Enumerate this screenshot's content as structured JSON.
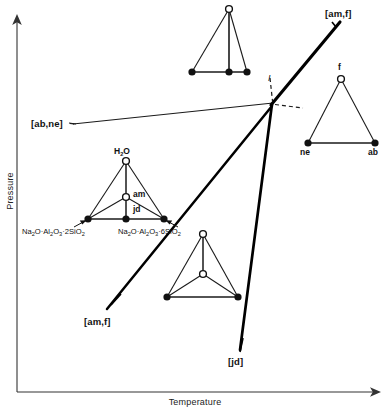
{
  "axes": {
    "y_label": "Pressure",
    "x_label": "Temperature"
  },
  "invariant_point": {
    "label": "I",
    "x": 273,
    "y": 103
  },
  "curve_labels": [
    {
      "id": "ab-ne",
      "text": "[ab,ne]",
      "x": 31,
      "y": 119
    },
    {
      "id": "am-f-upper",
      "text": "[am,f]",
      "x": 325,
      "y": 10
    },
    {
      "id": "am-f-lower",
      "text": "[am,f]",
      "x": 84,
      "y": 318
    },
    {
      "id": "jd",
      "text": "[jd]",
      "x": 228,
      "y": 358
    }
  ],
  "assemblages": [
    {
      "id": "top",
      "name": "top-tetrahedron",
      "apex_label": "",
      "vertices": [
        "",
        "",
        ""
      ],
      "description": "tetrahedron-top"
    },
    {
      "id": "right",
      "name": "right-triangle",
      "apex_label": "f",
      "left_label": "ne",
      "right_label": "ab"
    },
    {
      "id": "left",
      "name": "left-tetrahedron",
      "apex_label": "H2O",
      "interior_label": "am",
      "base_mid_label": "jd",
      "left_formula": "Na2O·Al2O3·2SiO2",
      "right_formula": "Na2O·Al2O3·6SiO2"
    },
    {
      "id": "bottom",
      "name": "bottom-tetrahedron",
      "apex_label": "",
      "interior_label": "",
      "description": "tetrahedron-bottom"
    }
  ],
  "vertex_labels": {
    "h2o": "H",
    "h2o_sub": "2",
    "h2o_tail": "O",
    "am": "am",
    "jd": "jd",
    "f": "f",
    "ne": "ne",
    "ab": "ab"
  },
  "formulas": {
    "left": {
      "p1": "Na",
      "s1": "2",
      "p2": "O·Al",
      "s2": "2",
      "p3": "O",
      "s3": "3",
      "p4": "·2SiO",
      "s4": "2"
    },
    "right": {
      "p1": "Na",
      "s1": "2",
      "p2": "O·Al",
      "s2": "2",
      "p3": "O",
      "s3": "3",
      "p4": "·6SiO",
      "s4": "2"
    }
  },
  "colors": {
    "line": "#1a1a1a",
    "thick_line": "#000000",
    "background": "#ffffff",
    "text": "#111111",
    "axis": "#333333"
  }
}
